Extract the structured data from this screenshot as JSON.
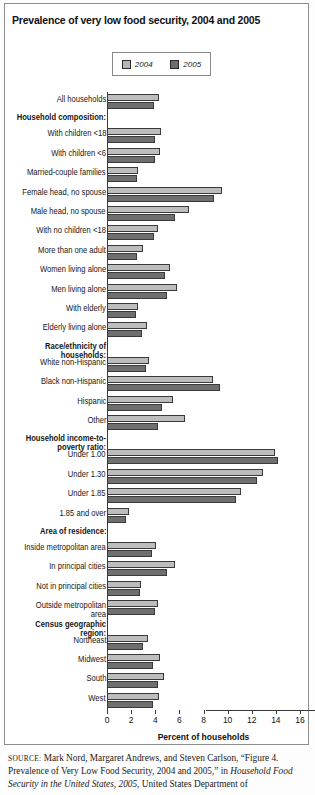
{
  "title": "Prevalence of very low food security, 2004 and 2005",
  "legend": {
    "items": [
      {
        "label": "2004",
        "color": "#bdbdbd"
      },
      {
        "label": "2005",
        "color": "#6f6f6f"
      }
    ]
  },
  "source": {
    "label": "SOURCE:",
    "part1": " Mark Nord, Margaret Andrews, and Steven Carlson, “Figure 4. Prevalence of Very Low Food Security, 2004 and 2005,” in ",
    "italic1": "Household Food Security in the United States, 2005",
    "part2": ", United States Department of"
  },
  "chart_data": {
    "type": "bar",
    "orientation": "horizontal",
    "title": "Prevalence of very low food security, 2004 and 2005",
    "xlabel": "Percent of households",
    "ylabel": "",
    "xlim": [
      0,
      16
    ],
    "xticks": [
      0,
      2,
      4,
      6,
      8,
      10,
      12,
      14,
      16
    ],
    "grid": false,
    "legend_position": "top-center",
    "categories": [
      "All households",
      "Household composition:",
      "With children <18",
      "With children <6",
      "Married-couple families",
      "Female head, no spouse",
      "Male head, no spouse",
      "With no children <18",
      "More than one adult",
      "Women living alone",
      "Men living alone",
      "With elderly",
      "Elderly living alone",
      "Race/ethnicity of households:",
      "White non-Hispanic",
      "Black non-Hispanic",
      "Hispanic",
      "Other",
      "Household income-to-poverty ratio:",
      "Under 1.00",
      "Under 1.30",
      "Under 1.85",
      "1.85 and over",
      "Area of residence:",
      "Inside metropolitan area",
      "In principal cities",
      "Not in principal cities",
      "Outside metropolitan area",
      "Census geographic region:",
      "Northeast",
      "Midwest",
      "South",
      "West"
    ],
    "header_rows": [
      1,
      13,
      18,
      23,
      28
    ],
    "series": [
      {
        "name": "2004",
        "color": "#bdbdbd",
        "values": [
          4.3,
          null,
          4.5,
          4.4,
          2.6,
          9.5,
          6.8,
          4.2,
          3.0,
          5.2,
          5.8,
          2.6,
          3.3,
          null,
          3.5,
          8.8,
          5.5,
          6.5,
          null,
          13.9,
          12.9,
          11.1,
          1.8,
          null,
          4.1,
          5.6,
          2.8,
          4.2,
          null,
          3.4,
          4.4,
          4.7,
          4.3
        ],
        "label_rows": [
          "All households",
          "With children <18",
          "With children <6",
          "Married-couple families",
          "Female head, no spouse",
          "Male head, no spouse",
          "With no children <18",
          "More than one adult",
          "Women living alone",
          "Men living alone",
          "With elderly",
          "Elderly living alone",
          "White non-Hispanic",
          "Black non-Hispanic",
          "Hispanic",
          "Other",
          "Under 1.00",
          "Under 1.30",
          "Under 1.85",
          "1.85 and over",
          "Inside metropolitan area",
          "In principal cities",
          "Not in principal cities",
          "Outside metropolitan area",
          "Northeast",
          "Midwest",
          "South",
          "West"
        ]
      },
      {
        "name": "2005",
        "color": "#6f6f6f",
        "values": [
          3.9,
          null,
          4.0,
          4.0,
          2.5,
          8.9,
          5.6,
          3.9,
          2.5,
          4.8,
          5.0,
          2.4,
          2.9,
          null,
          3.2,
          9.4,
          4.6,
          4.2,
          null,
          14.2,
          12.4,
          10.7,
          1.6,
          null,
          3.7,
          5.0,
          2.7,
          4.0,
          null,
          3.0,
          3.8,
          4.2,
          3.8
        ],
        "label_rows": [
          "All households",
          "With children <18",
          "With children <6",
          "Married-couple families",
          "Female head, no spouse",
          "Male head, no spouse",
          "With no children <18",
          "More than one adult",
          "Women living alone",
          "Men living alone",
          "With elderly",
          "Elderly living alone",
          "White non-Hispanic",
          "Black non-Hispanic",
          "Hispanic",
          "Other",
          "Under 1.00",
          "Under 1.30",
          "Under 1.85",
          "1.85 and over",
          "Inside metropolitan area",
          "In principal cities",
          "Not in principal cities",
          "Outside metropolitan area",
          "Northeast",
          "Midwest",
          "South",
          "West"
        ]
      }
    ]
  }
}
